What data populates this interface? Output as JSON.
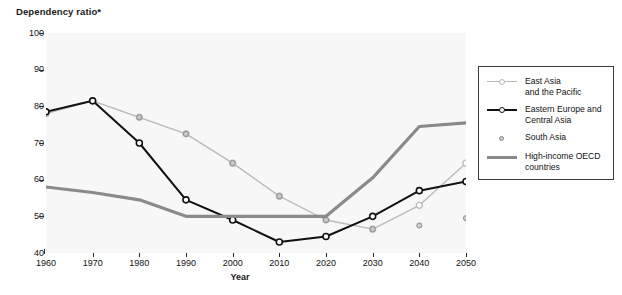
{
  "chart_data": {
    "type": "line",
    "title": "Dependency ratio*",
    "xlabel": "Year",
    "ylabel": "Dependency ratio*",
    "x": [
      1960,
      1970,
      1980,
      1990,
      2000,
      2010,
      2020,
      2030,
      2040,
      2050
    ],
    "xtick_labels": [
      "1960",
      "1970",
      "1980",
      "1990",
      "2000",
      "2010",
      "2020",
      "2030",
      "2040",
      "2050"
    ],
    "ytick_labels": [
      "40",
      "50",
      "60",
      "70",
      "80",
      "90",
      "100"
    ],
    "yticks": [
      40,
      50,
      60,
      70,
      80,
      90,
      100
    ],
    "ylim": [
      40,
      100
    ],
    "xlim": [
      1960,
      2050
    ],
    "grid": false,
    "legend_position": "right",
    "series": [
      {
        "name": "East Asia and the Pacific",
        "values": [
          78,
          81.5,
          77,
          72.5,
          64.5,
          55.5,
          49,
          46.5,
          53,
          64.5
        ],
        "color": "#b9b9b9",
        "marker": "open-circle",
        "width": 1.4
      },
      {
        "name": "Eastern Europe and Central Asia",
        "values": [
          78.5,
          81.5,
          70,
          54.5,
          49,
          43,
          44.5,
          50,
          57,
          59.5
        ],
        "color": "#111111",
        "marker": "open-circle",
        "width": 2.0
      },
      {
        "name": "South Asia",
        "values": [
          null,
          null,
          null,
          null,
          null,
          null,
          null,
          null,
          null,
          null
        ],
        "color": "#9a9a9a",
        "marker": "dot",
        "width": 0
      },
      {
        "name": "High-income OECD countries",
        "values": [
          58,
          56.5,
          54.5,
          50,
          50,
          50,
          50,
          60.5,
          74.5,
          75.5
        ],
        "color": "#8a8a8a",
        "marker": "none",
        "width": 3.2
      }
    ]
  },
  "legend": {
    "items": [
      {
        "label_line1": "East Asia",
        "label_line2": "and the Pacific",
        "key": "light-line-open-circle"
      },
      {
        "label_line1": "Eastern Europe and",
        "label_line2": "Central Asia",
        "key": "black-line-open-circle"
      },
      {
        "label_line1": "South Asia",
        "label_line2": "",
        "key": "grey-dot"
      },
      {
        "label_line1": "High-income OECD",
        "label_line2": "countries",
        "key": "thick-grey-line"
      }
    ]
  }
}
